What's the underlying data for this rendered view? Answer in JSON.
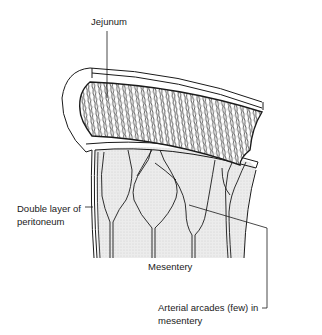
{
  "figure": {
    "type": "anatomical line drawing",
    "colors": {
      "ink": "#1a1a1a",
      "mesentery_fill": "#e6e6e6",
      "background": "#ffffff"
    }
  },
  "labels": {
    "jejunum": "Jejunum",
    "peritoneum_line1": "Double layer of",
    "peritoneum_line2": "peritoneum",
    "mesentery": "Mesentery",
    "arcades_line1": "Arterial arcades (few) in",
    "arcades_line2": "mesentery"
  }
}
